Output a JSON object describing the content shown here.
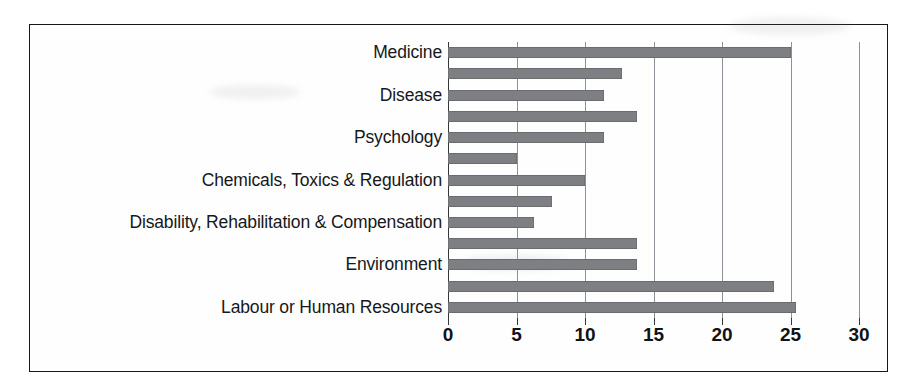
{
  "chart_data": {
    "type": "bar",
    "orientation": "horizontal",
    "title": "",
    "xlabel": "",
    "ylabel": "",
    "xlim": [
      0,
      30
    ],
    "xticks": [
      "0",
      "5",
      "10",
      "15",
      "20",
      "25",
      "30"
    ],
    "xtick_values": [
      0,
      5,
      10,
      15,
      20,
      25,
      30
    ],
    "grid": "vertical",
    "legend": "none",
    "bar_color": "#7d7f82",
    "axis_color": "#33373c",
    "gridline_color": "#8e9298",
    "categories": [
      "Medicine",
      "",
      "Disease",
      "",
      "Psychology",
      "",
      "Chemicals, Toxics & Regulation",
      "",
      "Disability, Rehabilitation & Compensation",
      "",
      "Environment",
      "",
      "Labour or Human Resources"
    ],
    "visible_labels": [
      "Medicine",
      "Disease",
      "Psychology",
      "Chemicals, Toxics & Regulation",
      "Disability, Rehabilitation & Compensation",
      "Environment",
      "Labour or Human Resources"
    ],
    "values": [
      25.0,
      12.7,
      11.4,
      13.8,
      11.4,
      5.0,
      10.0,
      7.6,
      6.3,
      13.8,
      13.8,
      23.8,
      25.4
    ],
    "bars": [
      {
        "label": "Medicine",
        "value": 25.0,
        "labelled": true
      },
      {
        "label": "",
        "value": 12.7,
        "labelled": false
      },
      {
        "label": "Disease",
        "value": 11.4,
        "labelled": true
      },
      {
        "label": "",
        "value": 13.8,
        "labelled": false
      },
      {
        "label": "Psychology",
        "value": 11.4,
        "labelled": true
      },
      {
        "label": "",
        "value": 5.0,
        "labelled": false
      },
      {
        "label": "Chemicals, Toxics & Regulation",
        "value": 10.0,
        "labelled": true
      },
      {
        "label": "",
        "value": 7.6,
        "labelled": false
      },
      {
        "label": "Disability, Rehabilitation & Compensation",
        "value": 6.3,
        "labelled": true
      },
      {
        "label": "",
        "value": 13.8,
        "labelled": false
      },
      {
        "label": "Environment",
        "value": 13.8,
        "labelled": true
      },
      {
        "label": "",
        "value": 23.8,
        "labelled": false
      },
      {
        "label": "Labour or Human Resources",
        "value": 25.4,
        "labelled": true
      }
    ]
  }
}
